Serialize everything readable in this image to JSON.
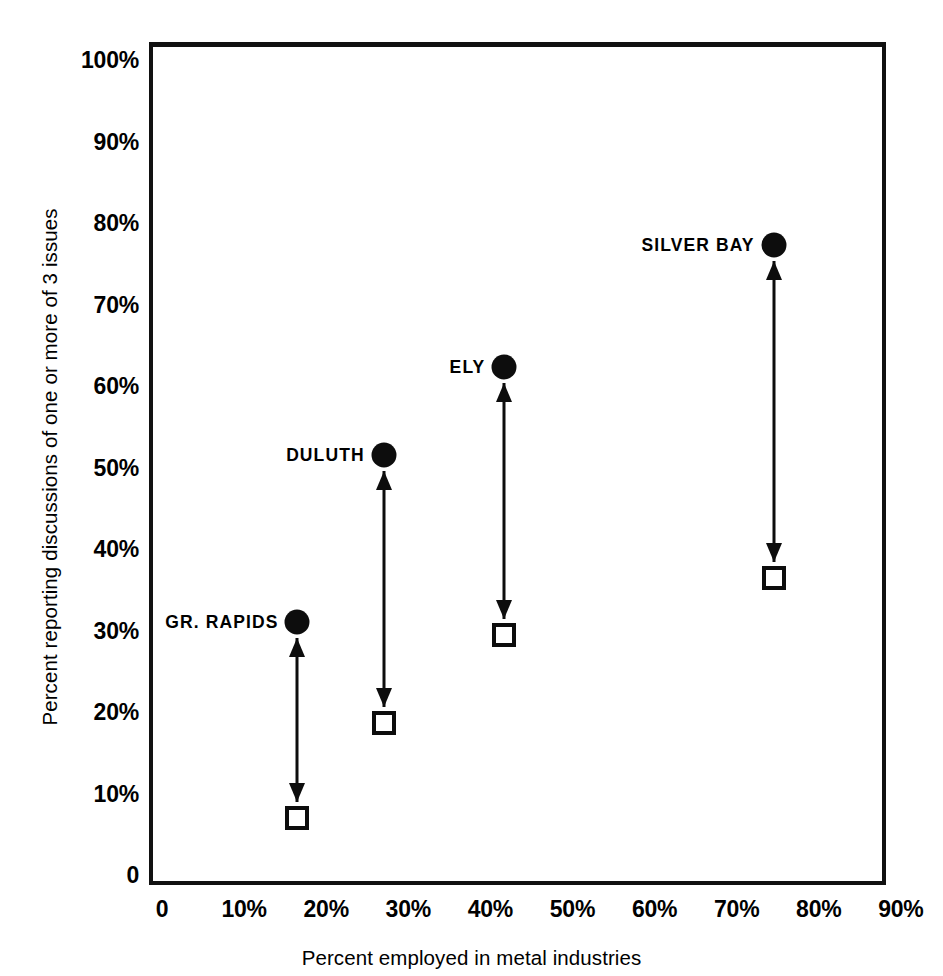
{
  "chart_data": {
    "type": "scatter",
    "title": "",
    "subtitle": "",
    "xlabel": "Percent employed in metal industries",
    "ylabel": "Percent reporting discussions of one or more of 3 issues",
    "xlim": [
      0,
      90
    ],
    "ylim": [
      0,
      100
    ],
    "grid": false,
    "legend_position": "none",
    "x_ticks": [
      "0",
      "10%",
      "20%",
      "30%",
      "40%",
      "50%",
      "60%",
      "70%",
      "80%",
      "90%"
    ],
    "x_tick_values": [
      0,
      10,
      20,
      30,
      40,
      50,
      60,
      70,
      80,
      90
    ],
    "y_ticks": [
      "0",
      "10%",
      "20%",
      "30%",
      "40%",
      "50%",
      "60%",
      "70%",
      "80%",
      "90%",
      "100%"
    ],
    "y_tick_values": [
      0,
      10,
      20,
      30,
      40,
      50,
      60,
      70,
      80,
      90,
      100
    ],
    "marker_legend": {
      "circle": "filled-circle",
      "square": "open-square"
    },
    "points": [
      {
        "label": "GR. RAPIDS",
        "x": 16.5,
        "high": 31,
        "low": 7,
        "label_side": "left"
      },
      {
        "label": "DULUTH",
        "x": 27,
        "high": 51.5,
        "low": 18.7,
        "label_side": "left"
      },
      {
        "label": "ELY",
        "x": 41.7,
        "high": 62.3,
        "low": 29.5,
        "label_side": "left"
      },
      {
        "label": "SILVER BAY",
        "x": 74.5,
        "high": 77.3,
        "low": 36.5,
        "label_side": "left"
      }
    ]
  },
  "colors": {
    "ink": "#0d0d0d",
    "background": "#ffffff",
    "frame": "#111111"
  }
}
